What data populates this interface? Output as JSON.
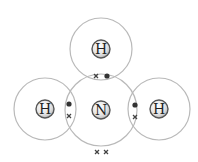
{
  "diagram": {
    "title": "",
    "molecule": "NH3 dot-and-cross diagram",
    "atoms": [
      {
        "id": "H-top",
        "symbol": "H",
        "cx": 101,
        "cy": 49,
        "shell_r": 31
      },
      {
        "id": "H-left",
        "symbol": "H",
        "cx": 45,
        "cy": 109,
        "shell_r": 31
      },
      {
        "id": "N-center",
        "symbol": "N",
        "cx": 101,
        "cy": 110,
        "shell_r": 36
      },
      {
        "id": "H-right",
        "symbol": "H",
        "cx": 159,
        "cy": 109,
        "shell_r": 31
      }
    ],
    "electrons": [
      {
        "type": "cross",
        "x": 96,
        "y": 76,
        "pair": "N-H top"
      },
      {
        "type": "dot",
        "x": 107,
        "y": 76,
        "pair": "N-H top"
      },
      {
        "type": "dot",
        "x": 69,
        "y": 104,
        "pair": "N-H left"
      },
      {
        "type": "cross",
        "x": 69,
        "y": 116,
        "pair": "N-H left"
      },
      {
        "type": "dot",
        "x": 135,
        "y": 105,
        "pair": "N-H right"
      },
      {
        "type": "cross",
        "x": 135,
        "y": 117,
        "pair": "N-H right"
      },
      {
        "type": "cross",
        "x": 97,
        "y": 152,
        "pair": "lone pair"
      },
      {
        "type": "cross",
        "x": 106,
        "y": 152,
        "pair": "lone pair"
      }
    ],
    "colors": {
      "shell": "#b9b9b9",
      "nucleus_fill": "#e6e6e6",
      "nucleus_stroke": "#555555",
      "electron": "#333333"
    }
  }
}
